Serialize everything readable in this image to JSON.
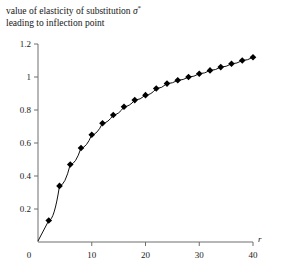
{
  "caption": {
    "line1_prefix": "value of elasticity of substitution ",
    "symbol": "σ",
    "symbol_sup": "*",
    "line2": "leading to inflection point"
  },
  "chart_data": {
    "type": "line",
    "title": "value of elasticity of substitution σ* leading to inflection point",
    "xlabel": "r",
    "ylabel": "",
    "xlim": [
      0,
      40
    ],
    "ylim": [
      0,
      1.2
    ],
    "grid": false,
    "legend": null,
    "marker": "diamond",
    "xticks": [
      0,
      10,
      20,
      30,
      40
    ],
    "xticklabels": [
      "0",
      "10",
      "20",
      "30",
      "40"
    ],
    "yticks": [
      0,
      0.2,
      0.4,
      0.6,
      0.8,
      1,
      1.2
    ],
    "yticklabels": [
      "0",
      "0.2",
      "0.4",
      "0.6",
      "0.8",
      "1",
      "1.2"
    ],
    "x": [
      2,
      4,
      6,
      8,
      10,
      12,
      14,
      16,
      18,
      20,
      22,
      24,
      26,
      28,
      30,
      32,
      34,
      36,
      38,
      40
    ],
    "values": [
      0.13,
      0.34,
      0.47,
      0.57,
      0.65,
      0.72,
      0.77,
      0.82,
      0.86,
      0.89,
      0.93,
      0.96,
      0.98,
      1.0,
      1.02,
      1.04,
      1.06,
      1.08,
      1.1,
      1.12
    ],
    "series": [
      {
        "name": "sigma-star",
        "values": [
          0.13,
          0.34,
          0.47,
          0.57,
          0.65,
          0.72,
          0.77,
          0.82,
          0.86,
          0.89,
          0.93,
          0.96,
          0.98,
          1.0,
          1.02,
          1.04,
          1.06,
          1.08,
          1.1,
          1.12
        ]
      }
    ],
    "colors": {
      "line": "#111111",
      "marker": "#000000",
      "axis": "#6e6e6e"
    }
  }
}
